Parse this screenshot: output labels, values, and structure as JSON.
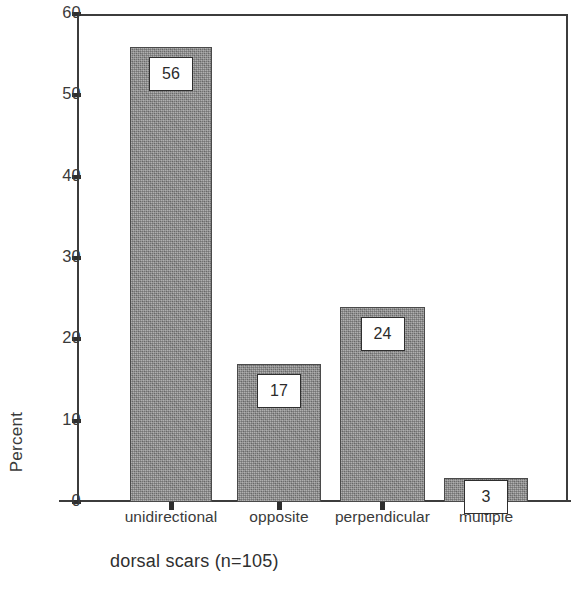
{
  "chart_data": {
    "type": "bar",
    "title": "",
    "subtitle": "",
    "caption": "dorsal scars (n=105)",
    "categories": [
      "unidirectional",
      "opposite",
      "perpendicular",
      "multiple"
    ],
    "values": [
      56,
      17,
      24,
      3
    ],
    "value_labels": [
      "56",
      "17",
      "24",
      "3"
    ],
    "series": [
      {
        "name": "Percent",
        "values": [
          56,
          17,
          24,
          3
        ]
      }
    ],
    "xlabel": "",
    "ylabel": "Percent",
    "ylim": [
      0,
      60
    ],
    "ytick_labels": [
      "0",
      "10",
      "20",
      "30",
      "40",
      "50",
      "60"
    ],
    "ytick_values": [
      0,
      10,
      20,
      30,
      40,
      50,
      60
    ],
    "grid": false,
    "legend": false,
    "legend_position": "none",
    "bar_fill_color": "#8b8b8b",
    "bar_border_color": "#4a4a4a",
    "axis_color": "#3c3c3c",
    "text_color": "#2f2f2f",
    "background_color": "#ffffff",
    "n": 105,
    "units": "percent"
  }
}
